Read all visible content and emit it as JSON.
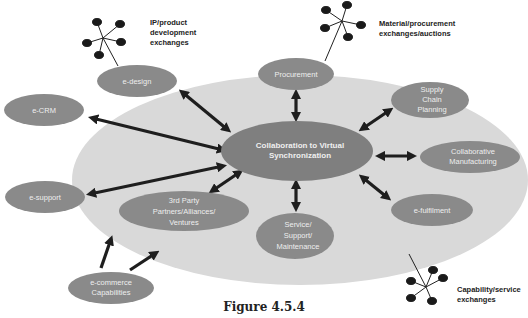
{
  "figure": {
    "caption": "Figure 4.5.4",
    "colors": {
      "background": "#ffffff",
      "big_ellipse": "#d9d9d9",
      "node_fill": "#888888",
      "node_text": "#eeeeee",
      "arrow": "#1e1e1e",
      "label_text": "#222222"
    },
    "center_node": {
      "line1": "Collaboration to Virtual",
      "line2": "Synchronization"
    },
    "inner_nodes": [
      {
        "id": "procurement",
        "lines": [
          "Procurement"
        ]
      },
      {
        "id": "supply-chain-planning",
        "lines": [
          "Supply",
          "Chain",
          "Planning"
        ]
      },
      {
        "id": "collaborative-manufacturing",
        "lines": [
          "Collaborative",
          "Manufacturing"
        ]
      },
      {
        "id": "e-fulfilment",
        "lines": [
          "e-fulfilment"
        ]
      },
      {
        "id": "service-support-maintenance",
        "lines": [
          "Service/",
          "Support/",
          "Maintenance"
        ]
      },
      {
        "id": "third-party",
        "lines": [
          "3rd Party",
          "Partners/Alliances/",
          "Ventures"
        ]
      }
    ],
    "outer_nodes": [
      {
        "id": "e-design",
        "lines": [
          "e-design"
        ]
      },
      {
        "id": "e-crm",
        "lines": [
          "e-CRM"
        ]
      },
      {
        "id": "e-support",
        "lines": [
          "e-support"
        ]
      },
      {
        "id": "e-commerce-capabilities",
        "lines": [
          "e-commerce",
          "Capabilities"
        ]
      }
    ],
    "exchanges": [
      {
        "id": "ip-product",
        "lines": [
          "IP/product",
          "development",
          "exchanges"
        ]
      },
      {
        "id": "material-procurement",
        "lines": [
          "Material/procurement",
          "exchanges/auctions"
        ]
      },
      {
        "id": "capability-service",
        "lines": [
          "Capability/service",
          "exchanges"
        ]
      }
    ]
  }
}
